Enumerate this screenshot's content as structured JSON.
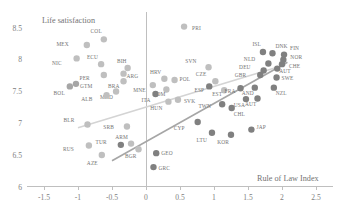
{
  "chart_data": {
    "type": "scatter",
    "title": "",
    "xlabel": "Rule of Law Index",
    "ylabel": "Life satisfaction",
    "xlim": [
      -1.75,
      2.75
    ],
    "ylim": [
      5.95,
      8.75
    ],
    "grid": false,
    "legend": "none",
    "xticks": [
      "-1.5",
      "-1",
      "-0.5",
      "0",
      "0.5",
      "1",
      "1.5",
      "2",
      "2.5"
    ],
    "xtick_values": [
      -1.5,
      -1,
      -0.5,
      0,
      0.5,
      1,
      1.5,
      2,
      2.5
    ],
    "yticks": [
      "8.5",
      "8",
      "7.5",
      "7",
      "6.5",
      "6"
    ],
    "ytick_values": [
      8.5,
      8.0,
      7.5,
      7.0,
      6.5,
      6.0
    ],
    "point_label_field": "country code",
    "points": [
      {
        "label": "PRI",
        "x": 0.56,
        "y": 8.52,
        "tone": "light",
        "lx": 8,
        "ly": 3
      },
      {
        "label": "COL",
        "x": -0.62,
        "y": 8.32,
        "tone": "light",
        "lx": -2,
        "ly": -6
      },
      {
        "label": "MEX",
        "x": -0.87,
        "y": 8.23,
        "tone": "light",
        "lx": -18,
        "ly": 1
      },
      {
        "label": "NIC",
        "x": -1.02,
        "y": 8.02,
        "tone": "light",
        "lx": -15,
        "ly": 7
      },
      {
        "label": "ECU",
        "x": -0.66,
        "y": 7.93,
        "tone": "light",
        "lx": -3,
        "ly": -5
      },
      {
        "label": "BIH",
        "x": -0.27,
        "y": 7.87,
        "tone": "light",
        "lx": -1,
        "ly": -5
      },
      {
        "label": "SVN",
        "x": 0.92,
        "y": 7.88,
        "tone": "light",
        "lx": -12,
        "ly": -4
      },
      {
        "label": "ISL",
        "x": 1.72,
        "y": 8.12,
        "tone": "dark",
        "lx": -2,
        "ly": -6
      },
      {
        "label": "DNK",
        "x": 1.86,
        "y": 8.1,
        "tone": "dark",
        "lx": 3,
        "ly": -5
      },
      {
        "label": "FIN",
        "x": 2.03,
        "y": 8.08,
        "tone": "dark",
        "lx": 6,
        "ly": -5
      },
      {
        "label": "NOR",
        "x": 2.02,
        "y": 8.0,
        "tone": "dark",
        "lx": 7,
        "ly": -1
      },
      {
        "label": "CHE",
        "x": 2.0,
        "y": 7.93,
        "tone": "dark",
        "lx": 7,
        "ly": 4
      },
      {
        "label": "NLD",
        "x": 1.8,
        "y": 7.94,
        "tone": "dark",
        "lx": -13,
        "ly": -2
      },
      {
        "label": "DEU",
        "x": 1.73,
        "y": 7.83,
        "tone": "dark",
        "lx": -13,
        "ly": -1
      },
      {
        "label": "AUT",
        "x": 1.93,
        "y": 7.86,
        "tone": "dark",
        "lx": 2,
        "ly": 4
      },
      {
        "label": "GBR",
        "x": 1.68,
        "y": 7.76,
        "tone": "dark",
        "lx": -14,
        "ly": 2
      },
      {
        "label": "SWE",
        "x": 1.92,
        "y": 7.72,
        "tone": "dark",
        "lx": 5,
        "ly": 3
      },
      {
        "label": "ARG",
        "x": -0.33,
        "y": 7.78,
        "tone": "light",
        "lx": 3,
        "ly": 4
      },
      {
        "label": "PER",
        "x": -0.62,
        "y": 7.76,
        "tone": "light",
        "lx": -14,
        "ly": 5
      },
      {
        "label": "HRV",
        "x": 0.27,
        "y": 7.7,
        "tone": "light",
        "lx": -3,
        "ly": -5
      },
      {
        "label": "POL",
        "x": 0.42,
        "y": 7.68,
        "tone": "light",
        "lx": 5,
        "ly": 1
      },
      {
        "label": "BRA",
        "x": -0.33,
        "y": 7.66,
        "tone": "light",
        "lx": -4,
        "ly": 7
      },
      {
        "label": "CZE",
        "x": 1.02,
        "y": 7.66,
        "tone": "light",
        "lx": -9,
        "ly": -5
      },
      {
        "label": "GTM",
        "x": -1.03,
        "y": 7.62,
        "tone": "mid",
        "lx": 4,
        "ly": 4
      },
      {
        "label": "BOL",
        "x": -1.12,
        "y": 7.58,
        "tone": "mid",
        "lx": -5,
        "ly": 9
      },
      {
        "label": "MNE",
        "x": 0.1,
        "y": 7.6,
        "tone": "light",
        "lx": -7,
        "ly": 7
      },
      {
        "label": "ESP",
        "x": 0.93,
        "y": 7.58,
        "tone": "dark",
        "lx": -5,
        "ly": 6
      },
      {
        "label": "EST",
        "x": 1.15,
        "y": 7.52,
        "tone": "light",
        "lx": -2,
        "ly": 6
      },
      {
        "label": "FRA",
        "x": 1.39,
        "y": 7.55,
        "tone": "dark",
        "lx": -5,
        "ly": 5
      },
      {
        "label": "AND",
        "x": 1.6,
        "y": 7.56,
        "tone": "dark",
        "lx": -1,
        "ly": 7
      },
      {
        "label": "NZL",
        "x": 1.88,
        "y": 7.56,
        "tone": "dark",
        "lx": 2,
        "ly": 7
      },
      {
        "label": "ROM",
        "x": 0.3,
        "y": 7.53,
        "tone": "light",
        "lx": -1,
        "ly": 6
      },
      {
        "label": "MKD",
        "x": -0.44,
        "y": 7.5,
        "tone": "light",
        "lx": -3,
        "ly": 8
      },
      {
        "label": "ALB",
        "x": -0.58,
        "y": 7.44,
        "tone": "light",
        "lx": -14,
        "ly": 6
      },
      {
        "label": "ITA",
        "x": 0.14,
        "y": 7.46,
        "tone": "dark",
        "lx": -5,
        "ly": 8
      },
      {
        "label": "SVK",
        "x": 0.47,
        "y": 7.37,
        "tone": "light",
        "lx": 6,
        "ly": 3
      },
      {
        "label": "USA",
        "x": 1.47,
        "y": 7.38,
        "tone": "dark",
        "lx": -1,
        "ly": 8
      },
      {
        "label": "AUT",
        "x": 1.64,
        "y": 7.39,
        "tone": "dark",
        "lx": -1,
        "ly": 8
      },
      {
        "label": "HUN",
        "x": 0.33,
        "y": 7.34,
        "tone": "light",
        "lx": -6,
        "ly": 8
      },
      {
        "label": "TWN",
        "x": 1.12,
        "y": 7.3,
        "tone": "dark",
        "lx": -11,
        "ly": 4
      },
      {
        "label": "CHL",
        "x": 1.26,
        "y": 7.24,
        "tone": "dark",
        "lx": 2,
        "ly": 8
      },
      {
        "label": "BLR",
        "x": -0.86,
        "y": 6.98,
        "tone": "light",
        "lx": -13,
        "ly": -3
      },
      {
        "label": "SRB",
        "x": -0.28,
        "y": 6.95,
        "tone": "light",
        "lx": -13,
        "ly": 3
      },
      {
        "label": "CYP",
        "x": 0.76,
        "y": 7.02,
        "tone": "dark",
        "lx": -13,
        "ly": 8
      },
      {
        "label": "JAP",
        "x": 1.55,
        "y": 6.9,
        "tone": "dark",
        "lx": 5,
        "ly": -1
      },
      {
        "label": "LTU",
        "x": 0.97,
        "y": 6.85,
        "tone": "dark",
        "lx": -5,
        "ly": 9
      },
      {
        "label": "KOR",
        "x": 1.25,
        "y": 6.82,
        "tone": "dark",
        "lx": -2,
        "ly": 9
      },
      {
        "label": "RUS",
        "x": -0.84,
        "y": 6.65,
        "tone": "light",
        "lx": -15,
        "ly": 5
      },
      {
        "label": "TUR",
        "x": -0.37,
        "y": 6.66,
        "tone": "dark",
        "lx": -14,
        "ly": -1
      },
      {
        "label": "ARM",
        "x": -0.22,
        "y": 6.68,
        "tone": "light",
        "lx": -3,
        "ly": -5
      },
      {
        "label": "BGR",
        "x": -0.11,
        "y": 6.59,
        "tone": "light",
        "lx": -2,
        "ly": 9
      },
      {
        "label": "AZE",
        "x": -0.65,
        "y": 6.5,
        "tone": "light",
        "lx": -4,
        "ly": 10
      },
      {
        "label": "GEO",
        "x": 0.15,
        "y": 6.53,
        "tone": "dark",
        "lx": 5,
        "ly": 2
      },
      {
        "label": "GRC",
        "x": 0.11,
        "y": 6.31,
        "tone": "dark",
        "lx": 5,
        "ly": 3
      }
    ],
    "trend_lines": [
      {
        "name": "flat-trend",
        "tone": "light",
        "x1": -1.0,
        "y1": 6.93,
        "x2": 2.05,
        "y2": 7.92
      },
      {
        "name": "steep-trend",
        "tone": "dark",
        "x1": -0.5,
        "y1": 6.41,
        "x2": 2.08,
        "y2": 7.96
      }
    ]
  },
  "axis": {
    "x_title": "Rule of Law Index",
    "y_title": "Life satisfaction"
  }
}
